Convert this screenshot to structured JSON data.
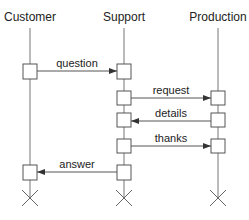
{
  "diagram": {
    "type": "sequence",
    "actors": [
      {
        "name": "Customer",
        "x": 30
      },
      {
        "name": "Support",
        "x": 124
      },
      {
        "name": "Production",
        "x": 218
      }
    ],
    "messages": [
      {
        "label": "question",
        "from": "Customer",
        "to": "Support"
      },
      {
        "label": "request",
        "from": "Support",
        "to": "Production"
      },
      {
        "label": "details",
        "from": "Production",
        "to": "Support"
      },
      {
        "label": "thanks",
        "from": "Support",
        "to": "Production"
      },
      {
        "label": "answer",
        "from": "Support",
        "to": "Customer"
      }
    ],
    "terminators": [
      "Customer",
      "Support",
      "Production"
    ]
  }
}
